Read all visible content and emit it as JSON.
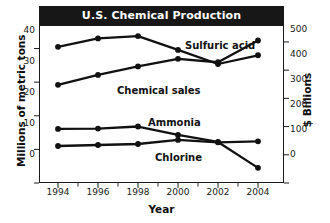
{
  "chart_data": {
    "type": "line",
    "title": "U.S. Chemical Production",
    "xlabel": "Year",
    "ylabel": "Millions of metric tons",
    "ylabel_right": "$ Billions",
    "x": [
      1994,
      1996,
      1998,
      2000,
      2002,
      2004
    ],
    "xticklabels": [
      "1994",
      "1996",
      "1998",
      "2000",
      "2002",
      "2004"
    ],
    "ylim": [
      0,
      47
    ],
    "yticks": [
      0,
      10,
      20,
      30,
      40
    ],
    "yticklabels": [
      "0",
      "10",
      "20",
      "30",
      "40"
    ],
    "ylim_right": [
      0,
      560
    ],
    "yticks_right": [
      0,
      100,
      200,
      300,
      400,
      500
    ],
    "yticklabels_right": [
      "0",
      "100",
      "200",
      "300",
      "400",
      "500"
    ],
    "grid": false,
    "legend": "inline-labels",
    "series": [
      {
        "name": "Sulfuric acid",
        "axis": "left",
        "units": "Millions of metric tons",
        "values": [
          40.5,
          43.0,
          43.7,
          39.6,
          35.4,
          38.0
        ]
      },
      {
        "name": "Chemical sales",
        "axis": "right",
        "units": "$ Billions",
        "values": [
          348,
          383,
          413,
          440,
          428,
          505
        ]
      },
      {
        "name": "Ammonia",
        "axis": "left",
        "units": "Millions of metric tons",
        "values": [
          16.1,
          16.2,
          16.8,
          14.3,
          12.2,
          4.5
        ]
      },
      {
        "name": "Chlorine",
        "axis": "left",
        "units": "Millions of metric tons",
        "values": [
          11.0,
          11.3,
          11.6,
          12.8,
          12.1,
          12.4
        ]
      }
    ],
    "colors": {
      "line": "#111111",
      "marker": "#111111",
      "title_banner_bg": "#171717",
      "title_text": "#ffffff",
      "axis": "#1a1a1a",
      "background": "#ffffff"
    }
  }
}
